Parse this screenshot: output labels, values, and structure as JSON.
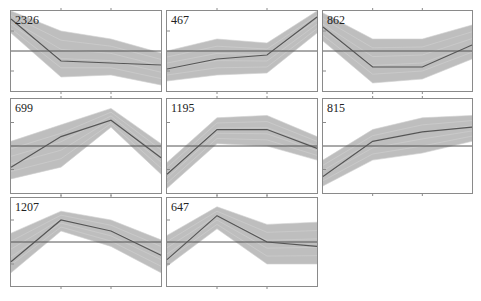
{
  "chart_data": [
    {
      "type": "line",
      "title": "2326",
      "count": 2326,
      "x": [
        1,
        2,
        3,
        4
      ],
      "mean": [
        1.6,
        -0.5,
        -0.6,
        -0.7
      ],
      "band_upper": [
        2.0,
        1.0,
        0.6,
        -0.1
      ],
      "band_lower": [
        0.9,
        -1.3,
        -1.2,
        -1.7
      ],
      "hline": 0
    },
    {
      "type": "line",
      "title": "467",
      "count": 467,
      "x": [
        1,
        2,
        3,
        4
      ],
      "mean": [
        -0.9,
        -0.4,
        -0.2,
        1.7
      ],
      "band_upper": [
        0.0,
        0.6,
        0.4,
        2.0
      ],
      "band_lower": [
        -1.5,
        -1.2,
        -1.1,
        0.9
      ],
      "hline": 0
    },
    {
      "type": "line",
      "title": "862",
      "count": 862,
      "x": [
        1,
        2,
        3,
        4
      ],
      "mean": [
        1.2,
        -0.8,
        -0.8,
        0.3
      ],
      "band_upper": [
        1.9,
        0.6,
        0.6,
        1.3
      ],
      "band_lower": [
        0.5,
        -1.6,
        -1.4,
        -0.4
      ],
      "hline": 0
    },
    {
      "type": "line",
      "title": "699",
      "count": 699,
      "x": [
        1,
        2,
        3,
        4
      ],
      "mean": [
        -0.9,
        0.4,
        1.1,
        -0.5
      ],
      "band_upper": [
        0.2,
        0.9,
        1.6,
        0.1
      ],
      "band_lower": [
        -1.4,
        -0.9,
        0.8,
        -1.2
      ],
      "hline": 0
    },
    {
      "type": "line",
      "title": "1195",
      "count": 1195,
      "x": [
        1,
        2,
        3,
        4
      ],
      "mean": [
        -1.2,
        0.7,
        0.7,
        -0.1
      ],
      "band_upper": [
        -0.7,
        1.2,
        1.3,
        0.4
      ],
      "band_lower": [
        -1.8,
        0.1,
        0.0,
        -0.6
      ],
      "hline": 0
    },
    {
      "type": "line",
      "title": "815",
      "count": 815,
      "x": [
        1,
        2,
        3,
        4
      ],
      "mean": [
        -1.3,
        0.2,
        0.6,
        0.8
      ],
      "band_upper": [
        -0.6,
        0.7,
        1.2,
        1.3
      ],
      "band_lower": [
        -1.7,
        -0.6,
        -0.3,
        0.2
      ],
      "hline": 0
    },
    {
      "type": "line",
      "title": "1207",
      "count": 1207,
      "x": [
        1,
        2,
        3,
        4
      ],
      "mean": [
        -0.9,
        1.0,
        0.5,
        -0.6
      ],
      "band_upper": [
        0.4,
        1.4,
        1.0,
        0.1
      ],
      "band_lower": [
        -1.4,
        0.5,
        -0.2,
        -1.4
      ],
      "hline": 0
    },
    {
      "type": "line",
      "title": "647",
      "count": 647,
      "x": [
        1,
        2,
        3,
        4
      ],
      "mean": [
        -0.8,
        1.2,
        0.0,
        -0.2
      ],
      "band_upper": [
        0.3,
        1.6,
        0.8,
        0.9
      ],
      "band_lower": [
        -1.1,
        0.6,
        -1.0,
        -1.0
      ],
      "hline": 0
    }
  ],
  "layout": {
    "rows": 3,
    "cols": 3,
    "ylim": [
      -2,
      2
    ],
    "grid": false,
    "legend": "none",
    "colors": {
      "band": "#b3b3b3",
      "mean": "#555555",
      "zero": "#555555",
      "frame": "#8a8a8a"
    }
  },
  "panels": [
    {
      "label": "2326"
    },
    {
      "label": "467"
    },
    {
      "label": "862"
    },
    {
      "label": "699"
    },
    {
      "label": "1195"
    },
    {
      "label": "815"
    },
    {
      "label": "1207"
    },
    {
      "label": "647"
    }
  ]
}
